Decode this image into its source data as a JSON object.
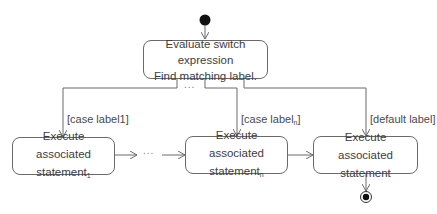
{
  "diagram": {
    "type": "UML activity diagram",
    "nodes": {
      "evaluate": {
        "line1": "Evaluate switch expression",
        "line2": "Find matching label."
      },
      "case1": {
        "line1": "Execute",
        "line2": "associated statement",
        "sub": "1"
      },
      "casen": {
        "line1": "Execute",
        "line2": "associated statement",
        "sub": "n"
      },
      "default": {
        "line1": "Execute",
        "line2": "associated statement"
      }
    },
    "guards": {
      "case1": {
        "text": "[case label1]"
      },
      "casen": {
        "prefix": "[case label",
        "sub": "n",
        "suffix": "]"
      },
      "default": {
        "text": "[default label]"
      }
    },
    "ellipsis_top": "...",
    "ellipsis_bottom": "...",
    "colors": {
      "line": "#6a6a6a",
      "node_fill": "#ffffff",
      "initial": "#111111"
    }
  }
}
